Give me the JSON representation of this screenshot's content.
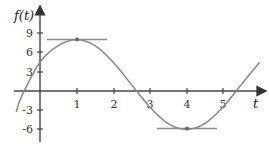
{
  "chart_data": {
    "type": "line",
    "title": "",
    "xlabel": "t",
    "ylabel": "f(t)",
    "x_ticks": [
      1,
      2,
      3,
      4,
      5
    ],
    "y_ticks": [
      9,
      6,
      3,
      -3,
      -6
    ],
    "x_tick_labels": [
      "1",
      "2",
      "3",
      "4",
      "5"
    ],
    "y_tick_labels": [
      "9",
      "6",
      "3",
      "-3",
      "-6"
    ],
    "xlim": [
      -0.75,
      6.1
    ],
    "ylim": [
      -7,
      10
    ],
    "grid": false,
    "legend": null,
    "series": [
      {
        "name": "f(t)",
        "x": [
          -0.65,
          -0.5,
          0,
          0.5,
          1,
          1.5,
          2,
          2.5,
          3,
          3.5,
          4,
          4.5,
          5,
          5.5,
          6
        ],
        "values": [
          -3.3,
          -0.8,
          4.5,
          7.1,
          8,
          7.1,
          4.5,
          1.0,
          -2.5,
          -5.1,
          -6,
          -5.1,
          -2.5,
          1.0,
          4.5
        ]
      }
    ],
    "annotations": [
      {
        "type": "horizontal-tangent",
        "point": [
          1,
          8
        ],
        "label": "local maximum"
      },
      {
        "type": "horizontal-tangent",
        "point": [
          4,
          -6
        ],
        "label": "local minimum"
      }
    ]
  },
  "labels": {
    "y_axis_title": "f(t)",
    "x_axis_title": "t",
    "x_ticks": [
      "1",
      "2",
      "3",
      "4",
      "5"
    ],
    "y_ticks": [
      "9",
      "6",
      "3",
      "-3",
      "-6"
    ]
  }
}
